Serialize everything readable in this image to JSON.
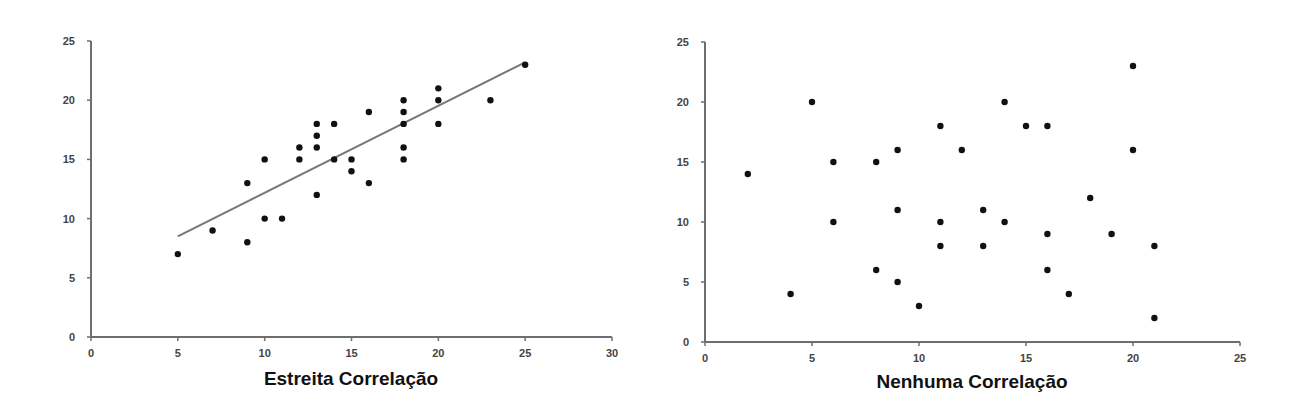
{
  "chart_data": [
    {
      "type": "scatter",
      "title": "Estreita Correlação",
      "xlabel": "",
      "ylabel": "",
      "xlim": [
        0,
        30
      ],
      "ylim": [
        0,
        25
      ],
      "xticks": [
        0,
        5,
        10,
        15,
        20,
        25,
        30
      ],
      "yticks": [
        0,
        5,
        10,
        15,
        20,
        25
      ],
      "grid": false,
      "legend": "none",
      "series": [
        {
          "name": "pontos",
          "points": [
            [
              5,
              7
            ],
            [
              7,
              9
            ],
            [
              9,
              8
            ],
            [
              9,
              13
            ],
            [
              10,
              10
            ],
            [
              10,
              15
            ],
            [
              11,
              10
            ],
            [
              12,
              16
            ],
            [
              12,
              15
            ],
            [
              13,
              18
            ],
            [
              13,
              17
            ],
            [
              13,
              16
            ],
            [
              13,
              12
            ],
            [
              14,
              18
            ],
            [
              14,
              15
            ],
            [
              15,
              15
            ],
            [
              15,
              14
            ],
            [
              16,
              19
            ],
            [
              16,
              13
            ],
            [
              18,
              20
            ],
            [
              18,
              19
            ],
            [
              18,
              18
            ],
            [
              18,
              16
            ],
            [
              18,
              15
            ],
            [
              20,
              21
            ],
            [
              20,
              20
            ],
            [
              20,
              18
            ],
            [
              23,
              20
            ],
            [
              25,
              23
            ]
          ]
        }
      ],
      "trendline": {
        "x": [
          5,
          25
        ],
        "y": [
          8.5,
          23.2
        ]
      }
    },
    {
      "type": "scatter",
      "title": "Nenhuma Correlação",
      "xlabel": "",
      "ylabel": "",
      "xlim": [
        0,
        25
      ],
      "ylim": [
        0,
        25
      ],
      "xticks": [
        0,
        5,
        10,
        15,
        20,
        25
      ],
      "yticks": [
        0,
        5,
        10,
        15,
        20,
        25
      ],
      "grid": false,
      "legend": "none",
      "series": [
        {
          "name": "pontos",
          "points": [
            [
              2,
              14
            ],
            [
              4,
              4
            ],
            [
              5,
              20
            ],
            [
              6,
              15
            ],
            [
              6,
              10
            ],
            [
              8,
              15
            ],
            [
              8,
              6
            ],
            [
              9,
              16
            ],
            [
              9,
              11
            ],
            [
              9,
              5
            ],
            [
              10,
              3
            ],
            [
              11,
              18
            ],
            [
              11,
              10
            ],
            [
              11,
              8
            ],
            [
              12,
              16
            ],
            [
              13,
              11
            ],
            [
              13,
              8
            ],
            [
              14,
              20
            ],
            [
              14,
              10
            ],
            [
              15,
              18
            ],
            [
              16,
              18
            ],
            [
              16,
              9
            ],
            [
              16,
              6
            ],
            [
              17,
              4
            ],
            [
              18,
              12
            ],
            [
              19,
              9
            ],
            [
              20,
              23
            ],
            [
              20,
              16
            ],
            [
              21,
              8
            ],
            [
              21,
              2
            ]
          ]
        }
      ]
    }
  ]
}
